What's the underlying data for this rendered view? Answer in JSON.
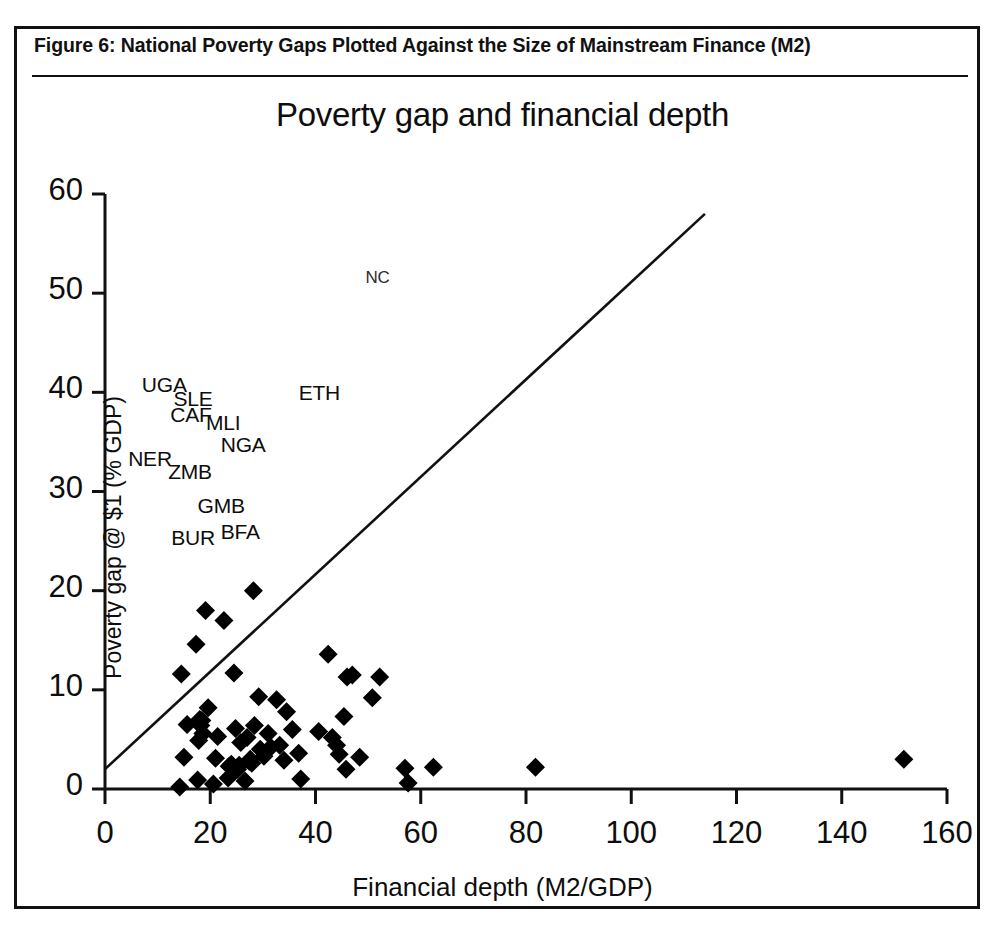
{
  "figure": {
    "caption": "Figure 6:  National Poverty Gaps Plotted Against the Size of Mainstream Finance (M2)"
  },
  "chart_data": {
    "type": "scatter",
    "title": "Poverty gap and financial depth",
    "xlabel": "Financial depth (M2/GDP)",
    "ylabel": "Poverty gap @ $1 (% GDP)",
    "xlim": [
      0,
      160
    ],
    "ylim": [
      0,
      60
    ],
    "xticks": [
      0,
      20,
      40,
      60,
      80,
      100,
      120,
      140,
      160
    ],
    "yticks": [
      0,
      10,
      20,
      30,
      40,
      50,
      60
    ],
    "grid": false,
    "legend": null,
    "marker": "diamond",
    "marker_color": "#000000",
    "series": [
      {
        "name": "Countries",
        "points": [
          [
            14.2,
            0.2
          ],
          [
            14.5,
            11.6
          ],
          [
            15.0,
            3.2
          ],
          [
            15.6,
            6.5
          ],
          [
            17.3,
            14.6
          ],
          [
            17.6,
            0.9
          ],
          [
            17.8,
            4.9
          ],
          [
            18.0,
            7.0
          ],
          [
            18.2,
            6.4
          ],
          [
            18.4,
            6.9
          ],
          [
            18.6,
            5.6
          ],
          [
            19.1,
            18.0
          ],
          [
            19.6,
            8.2
          ],
          [
            20.6,
            0.5
          ],
          [
            21.0,
            3.1
          ],
          [
            21.4,
            5.3
          ],
          [
            22.6,
            17.0
          ],
          [
            23.4,
            1.1
          ],
          [
            23.6,
            2.3
          ],
          [
            24.0,
            2.5
          ],
          [
            24.5,
            11.7
          ],
          [
            24.8,
            6.1
          ],
          [
            25.2,
            2.0
          ],
          [
            25.5,
            2.4
          ],
          [
            25.8,
            4.7
          ],
          [
            26.6,
            0.8
          ],
          [
            27.0,
            5.2
          ],
          [
            27.4,
            2.8
          ],
          [
            27.6,
            3.0
          ],
          [
            27.9,
            2.6
          ],
          [
            28.2,
            20.0
          ],
          [
            28.4,
            6.4
          ],
          [
            29.2,
            9.3
          ],
          [
            29.5,
            4.0
          ],
          [
            30.2,
            3.3
          ],
          [
            31.0,
            5.6
          ],
          [
            31.5,
            4.2
          ],
          [
            32.6,
            9.0
          ],
          [
            33.2,
            4.4
          ],
          [
            34.0,
            2.9
          ],
          [
            34.5,
            7.8
          ],
          [
            35.6,
            6.0
          ],
          [
            36.8,
            3.6
          ],
          [
            37.2,
            1.0
          ],
          [
            40.6,
            5.8
          ],
          [
            42.4,
            13.6
          ],
          [
            43.2,
            5.2
          ],
          [
            44.0,
            4.4
          ],
          [
            44.5,
            3.5
          ],
          [
            45.4,
            7.3
          ],
          [
            45.8,
            2.0
          ],
          [
            46.0,
            11.3
          ],
          [
            47.0,
            11.5
          ],
          [
            48.4,
            3.2
          ],
          [
            50.8,
            9.2
          ],
          [
            52.2,
            11.3
          ],
          [
            57.0,
            2.1
          ],
          [
            57.6,
            0.6
          ],
          [
            62.4,
            2.2
          ],
          [
            81.8,
            2.2
          ],
          [
            151.8,
            3.0
          ]
        ]
      }
    ],
    "trend_line": {
      "name": "45-degree reference line",
      "from": [
        0,
        2.0
      ],
      "to": [
        114.0,
        58.0
      ]
    },
    "annotations": [
      {
        "text": "NC",
        "x": 49.5,
        "y": 51.2,
        "style": "faint"
      },
      {
        "text": "UGA",
        "x": 7.0,
        "y": 40.6,
        "style": "normal"
      },
      {
        "text": "SLE",
        "x": 13.0,
        "y": 39.2,
        "style": "normal"
      },
      {
        "text": "CAF",
        "x": 12.4,
        "y": 37.6,
        "style": "normal"
      },
      {
        "text": "MLI",
        "x": 19.2,
        "y": 36.8,
        "style": "normal"
      },
      {
        "text": "ETH",
        "x": 36.8,
        "y": 39.8,
        "style": "normal"
      },
      {
        "text": "NGA",
        "x": 22.0,
        "y": 34.6,
        "style": "normal"
      },
      {
        "text": "NER",
        "x": 4.4,
        "y": 33.2,
        "style": "normal"
      },
      {
        "text": "ZMB",
        "x": 12.0,
        "y": 31.9,
        "style": "normal"
      },
      {
        "text": "GMB",
        "x": 17.6,
        "y": 28.4,
        "style": "normal"
      },
      {
        "text": "BUR",
        "x": 12.6,
        "y": 25.2,
        "style": "normal"
      },
      {
        "text": "BFA",
        "x": 22.0,
        "y": 25.8,
        "style": "normal"
      }
    ]
  }
}
